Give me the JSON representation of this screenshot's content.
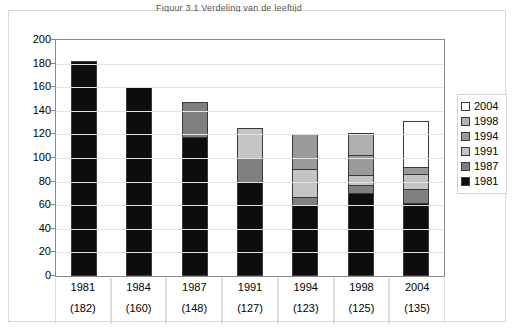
{
  "chart_data": {
    "type": "bar",
    "subtype": "stacked-column",
    "title": "Figuur 3.1 Verdeling van de leeftijd",
    "xlabel": "",
    "ylabel": "",
    "ylim": [
      0,
      200
    ],
    "ytick_step": 20,
    "yticks": [
      200,
      180,
      160,
      140,
      120,
      100,
      80,
      60,
      40,
      20,
      0
    ],
    "grid": true,
    "legend_position": "right",
    "categories": [
      "1981",
      "1984",
      "1987",
      "1991",
      "1994",
      "1998",
      "2004"
    ],
    "category_totals": [
      182,
      160,
      148,
      127,
      123,
      125,
      135
    ],
    "category_totals_display": [
      "(182)",
      "(160)",
      "(148)",
      "(127)",
      "(123)",
      "(125)",
      "(135)"
    ],
    "series": [
      {
        "name": "1981",
        "color": "#0d0d0d",
        "values": [
          182,
          160,
          118,
          80,
          60,
          70,
          62
        ]
      },
      {
        "name": "1987",
        "color": "#808080",
        "values": [
          0,
          0,
          30,
          21,
          8,
          8,
          13
        ]
      },
      {
        "name": "1991",
        "color": "#c4c4c4",
        "values": [
          0,
          0,
          0,
          26,
          24,
          9,
          13
        ]
      },
      {
        "name": "1994",
        "color": "#9a9a9a",
        "values": [
          0,
          0,
          0,
          0,
          31,
          18,
          7
        ]
      },
      {
        "name": "1998",
        "color": "#b0b0b0",
        "values": [
          0,
          0,
          0,
          0,
          0,
          20,
          0
        ]
      },
      {
        "name": "2004",
        "color": "#ffffff",
        "values": [
          0,
          0,
          0,
          0,
          0,
          0,
          40
        ]
      }
    ]
  },
  "legend": {
    "items": [
      {
        "label": "2004",
        "color": "#ffffff"
      },
      {
        "label": "1998",
        "color": "#b0b0b0"
      },
      {
        "label": "1994",
        "color": "#9a9a9a"
      },
      {
        "label": "1991",
        "color": "#c4c4c4"
      },
      {
        "label": "1987",
        "color": "#808080"
      },
      {
        "label": "1981",
        "color": "#0d0d0d"
      }
    ]
  },
  "colors": {
    "plot_border": "#8a8a8a",
    "grid": "#e2e2e2",
    "frame": "#d8d8d8",
    "bar_outline": "#3a3a3a",
    "text": "#000000"
  }
}
